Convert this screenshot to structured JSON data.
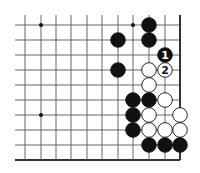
{
  "board": {
    "title": "Go problem diagram (lower-right corner)",
    "colors": {
      "background": "#ffffff",
      "line": "#555555",
      "edge": "#333333",
      "black": "#111111",
      "white": "#ffffff"
    },
    "grid": {
      "columns_x": [
        25,
        41,
        56,
        71,
        87,
        102,
        118,
        133,
        149,
        165,
        180
      ],
      "rows_y": [
        25,
        40,
        55,
        70,
        85,
        100,
        115,
        130,
        145,
        160
      ],
      "line_extend_left": 15,
      "line_extend_top": 15,
      "right_edge_x": 180,
      "bottom_edge_y": 160
    },
    "hoshi": [
      {
        "x": 41,
        "y": 25
      },
      {
        "x": 133,
        "y": 25
      },
      {
        "x": 41,
        "y": 115
      }
    ],
    "stones": [
      {
        "color": "black",
        "x": 149,
        "y": 25
      },
      {
        "color": "black",
        "x": 118,
        "y": 40
      },
      {
        "color": "black",
        "x": 149,
        "y": 40
      },
      {
        "color": "black",
        "x": 165,
        "y": 55,
        "label": "1"
      },
      {
        "color": "black",
        "x": 118,
        "y": 70
      },
      {
        "color": "white",
        "x": 149,
        "y": 70
      },
      {
        "color": "white",
        "x": 165,
        "y": 70,
        "label": "2"
      },
      {
        "color": "white",
        "x": 149,
        "y": 85
      },
      {
        "color": "black",
        "x": 133,
        "y": 100
      },
      {
        "color": "black",
        "x": 149,
        "y": 100
      },
      {
        "color": "white",
        "x": 165,
        "y": 100
      },
      {
        "color": "black",
        "x": 133,
        "y": 115
      },
      {
        "color": "white",
        "x": 149,
        "y": 115
      },
      {
        "color": "white",
        "x": 180,
        "y": 115
      },
      {
        "color": "black",
        "x": 133,
        "y": 130
      },
      {
        "color": "white",
        "x": 149,
        "y": 130
      },
      {
        "color": "white",
        "x": 165,
        "y": 130
      },
      {
        "color": "white",
        "x": 180,
        "y": 130
      },
      {
        "color": "black",
        "x": 149,
        "y": 145
      },
      {
        "color": "black",
        "x": 165,
        "y": 145
      },
      {
        "color": "black",
        "x": 180,
        "y": 145
      }
    ],
    "move_labels": [
      "1",
      "2"
    ]
  }
}
